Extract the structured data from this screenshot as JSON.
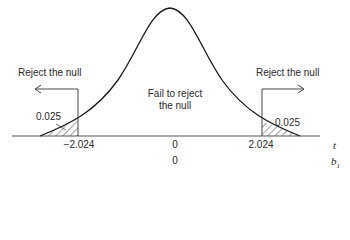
{
  "diagram": {
    "type": "two-tailed-t-test-rejection-regions",
    "regions": {
      "left_reject_label": "Reject the null",
      "right_reject_label": "Reject the null",
      "center_label_line1": "Fail to reject",
      "center_label_line2": "the null"
    },
    "tail_areas": {
      "left": "0.025",
      "right": "0.025"
    },
    "axis": {
      "t_label": "t",
      "b_label": "b",
      "b_subscript": "1",
      "t_ticks": [
        "−2.024",
        "0",
        "2.024"
      ],
      "b_ticks": [
        "0"
      ]
    },
    "colors": {
      "curve": "#1a1a1a",
      "axis": "#555555",
      "hatch": "#444444",
      "text": "#2a2a2a"
    }
  }
}
